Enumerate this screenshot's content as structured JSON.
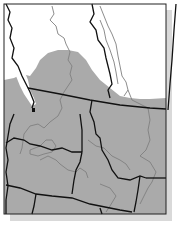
{
  "map": {
    "type": "regional range map",
    "region": "Pacific Northwest / northern Rockies",
    "colors": {
      "range_fill": "#a9a9a9",
      "background": "#ffffff",
      "border": "#111111",
      "river": "#7f7f7f",
      "shadow": "#d6d6d6"
    }
  }
}
